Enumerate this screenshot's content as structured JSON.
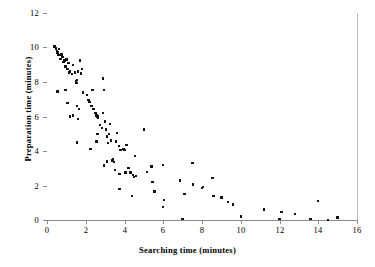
{
  "chart_data": {
    "type": "scatter",
    "title": "",
    "xlabel": "Searching time (minutes)",
    "ylabel": "Preparation time (minutes)",
    "xlim": [
      0,
      16
    ],
    "ylim": [
      0,
      12
    ],
    "xticks": [
      0,
      2,
      4,
      6,
      8,
      10,
      12,
      14,
      16
    ],
    "yticks": [
      0,
      2,
      4,
      6,
      8,
      10,
      12
    ],
    "grid": "horizontal",
    "legend": null,
    "marker_color": "#111111",
    "gridline_color": "#9e9e9e",
    "axis_color": "#8a8a8a",
    "series": [
      {
        "name": "observations",
        "points": [
          [
            0.38,
            10.05
          ],
          [
            0.45,
            9.95
          ],
          [
            0.5,
            9.8
          ],
          [
            0.55,
            9.7
          ],
          [
            0.6,
            9.55
          ],
          [
            0.62,
            9.9
          ],
          [
            0.7,
            9.35
          ],
          [
            0.75,
            9.6
          ],
          [
            0.8,
            9.45
          ],
          [
            0.85,
            9.15
          ],
          [
            0.9,
            9.25
          ],
          [
            0.95,
            8.9
          ],
          [
            1.0,
            9.3
          ],
          [
            1.05,
            8.75
          ],
          [
            1.1,
            9.1
          ],
          [
            1.15,
            8.55
          ],
          [
            1.2,
            8.6
          ],
          [
            1.3,
            8.45
          ],
          [
            1.35,
            9.0
          ],
          [
            1.45,
            8.55
          ],
          [
            1.5,
            8.05
          ],
          [
            1.52,
            7.95
          ],
          [
            1.55,
            8.1
          ],
          [
            1.6,
            8.6
          ],
          [
            1.7,
            9.25
          ],
          [
            1.75,
            8.5
          ],
          [
            0.55,
            7.45
          ],
          [
            0.95,
            7.55
          ],
          [
            1.05,
            6.8
          ],
          [
            1.2,
            6.0
          ],
          [
            1.35,
            6.05
          ],
          [
            1.6,
            5.85
          ],
          [
            1.55,
            6.6
          ],
          [
            1.65,
            6.45
          ],
          [
            1.8,
            8.75
          ],
          [
            1.85,
            7.4
          ],
          [
            2.05,
            7.25
          ],
          [
            2.15,
            6.95
          ],
          [
            2.2,
            6.85
          ],
          [
            2.3,
            6.6
          ],
          [
            2.4,
            6.45
          ],
          [
            2.5,
            6.2
          ],
          [
            2.55,
            6.05
          ],
          [
            2.6,
            6.0
          ],
          [
            2.62,
            5.95
          ],
          [
            2.35,
            7.55
          ],
          [
            2.9,
            8.2
          ],
          [
            2.95,
            7.55
          ],
          [
            1.55,
            4.5
          ],
          [
            2.25,
            4.1
          ],
          [
            2.55,
            4.55
          ],
          [
            2.6,
            5.0
          ],
          [
            2.75,
            5.5
          ],
          [
            2.85,
            5.35
          ],
          [
            2.9,
            6.2
          ],
          [
            3.0,
            5.7
          ],
          [
            3.05,
            5.25
          ],
          [
            3.1,
            4.85
          ],
          [
            3.15,
            4.45
          ],
          [
            3.2,
            5.0
          ],
          [
            3.25,
            5.55
          ],
          [
            3.3,
            4.6
          ],
          [
            2.95,
            3.15
          ],
          [
            3.1,
            3.4
          ],
          [
            3.35,
            3.45
          ],
          [
            3.4,
            3.5
          ],
          [
            3.45,
            3.35
          ],
          [
            3.5,
            2.9
          ],
          [
            3.55,
            4.55
          ],
          [
            3.6,
            5.05
          ],
          [
            3.7,
            4.3
          ],
          [
            3.75,
            2.65
          ],
          [
            3.8,
            4.05
          ],
          [
            3.95,
            4.1
          ],
          [
            4.0,
            4.05
          ],
          [
            4.05,
            2.75
          ],
          [
            4.1,
            4.35
          ],
          [
            4.2,
            3.0
          ],
          [
            4.3,
            2.75
          ],
          [
            4.45,
            2.6
          ],
          [
            4.5,
            2.5
          ],
          [
            4.55,
            3.7
          ],
          [
            4.6,
            2.55
          ],
          [
            3.75,
            1.8
          ],
          [
            4.4,
            1.4
          ],
          [
            5.0,
            5.25
          ],
          [
            5.15,
            2.8
          ],
          [
            5.4,
            3.1
          ],
          [
            5.45,
            2.2
          ],
          [
            5.55,
            1.65
          ],
          [
            6.0,
            3.2
          ],
          [
            6.05,
            1.15
          ],
          [
            6.0,
            0.75
          ],
          [
            6.85,
            2.3
          ],
          [
            7.0,
            0.05
          ],
          [
            7.1,
            1.5
          ],
          [
            7.5,
            3.3
          ],
          [
            7.55,
            2.05
          ],
          [
            8.0,
            1.85
          ],
          [
            8.05,
            1.9
          ],
          [
            8.55,
            2.45
          ],
          [
            8.6,
            1.4
          ],
          [
            9.0,
            1.3
          ],
          [
            9.35,
            1.05
          ],
          [
            9.6,
            0.9
          ],
          [
            10.0,
            0.2
          ],
          [
            11.2,
            0.6
          ],
          [
            12.0,
            0.05
          ],
          [
            12.1,
            0.45
          ],
          [
            12.8,
            0.35
          ],
          [
            13.6,
            0.05
          ],
          [
            14.0,
            1.1
          ],
          [
            14.5,
            0.0
          ],
          [
            15.0,
            0.15
          ]
        ]
      }
    ]
  },
  "axes": {
    "x_title": "Searching time (minutes)",
    "y_title": "Preparation time (minutes)",
    "x_tick_labels": [
      "0",
      "2",
      "4",
      "6",
      "8",
      "10",
      "12",
      "14",
      "16"
    ],
    "y_tick_labels": [
      "0",
      "2",
      "4",
      "6",
      "8",
      "10",
      "12"
    ]
  }
}
